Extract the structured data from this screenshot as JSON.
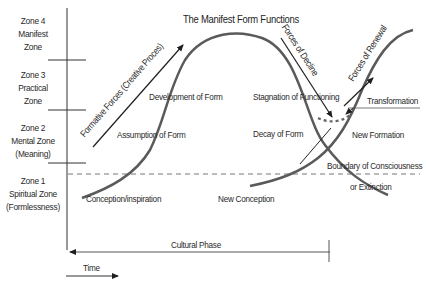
{
  "title": "The Manifest Form Functions",
  "zones": [
    {
      "lines": [
        "Zone 4",
        "Manifest",
        "Zone"
      ]
    },
    {
      "lines": [
        "Zone 3",
        "Practical",
        "Zone"
      ]
    },
    {
      "lines": [
        "Zone 2",
        "Mental Zone",
        "(Meaning)"
      ]
    },
    {
      "lines": [
        "Zone 1",
        "Spiritual Zone",
        "(Formlessness)"
      ]
    }
  ],
  "labels": {
    "development_of_form": "Development of Form",
    "assumption_of_form": "Assumption of Form",
    "conception_inspiration": "Conception/inspiration",
    "stagnation": "Stagnation of Functioning",
    "decay_of_form": "Decay of Form",
    "new_conception": "New Conception",
    "transformation": "Transformation",
    "new_formation": "New Formation",
    "boundary": "Boundary of Consciousness",
    "extinction": "or Extinction",
    "cultural_phase": "Cultural Phase",
    "time": "Time"
  },
  "arrows": {
    "formative": "Formative Forces (Creative Proces)",
    "decline": "Forces of Decline",
    "renewal": "Forces of Renewal"
  },
  "colors": {
    "curve": "#5a5a5a",
    "line": "#222222",
    "text": "#2a2a2a",
    "dashed": "#777777"
  }
}
